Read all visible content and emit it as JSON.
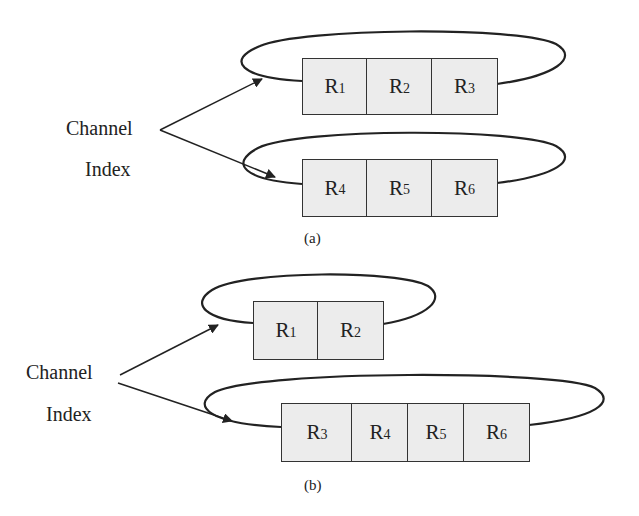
{
  "figure_a": {
    "label_line1": "Channel",
    "label_line2": "Index",
    "caption": "(a)",
    "channels": [
      {
        "registers": [
          {
            "base": "R",
            "sub": "1"
          },
          {
            "base": "R",
            "sub": "2"
          },
          {
            "base": "R",
            "sub": "3"
          }
        ]
      },
      {
        "registers": [
          {
            "base": "R",
            "sub": "4"
          },
          {
            "base": "R",
            "sub": "5"
          },
          {
            "base": "R",
            "sub": "6"
          }
        ]
      }
    ]
  },
  "figure_b": {
    "label_line1": "Channel",
    "label_line2": "Index",
    "caption": "(b)",
    "channels": [
      {
        "registers": [
          {
            "base": "R",
            "sub": "1"
          },
          {
            "base": "R",
            "sub": "2"
          }
        ]
      },
      {
        "registers": [
          {
            "base": "R",
            "sub": "3"
          },
          {
            "base": "R",
            "sub": "4"
          },
          {
            "base": "R",
            "sub": "5"
          },
          {
            "base": "R",
            "sub": "6"
          }
        ]
      }
    ]
  },
  "colors": {
    "stroke": "#222222",
    "box_fill": "#ececec",
    "background": "#ffffff"
  }
}
